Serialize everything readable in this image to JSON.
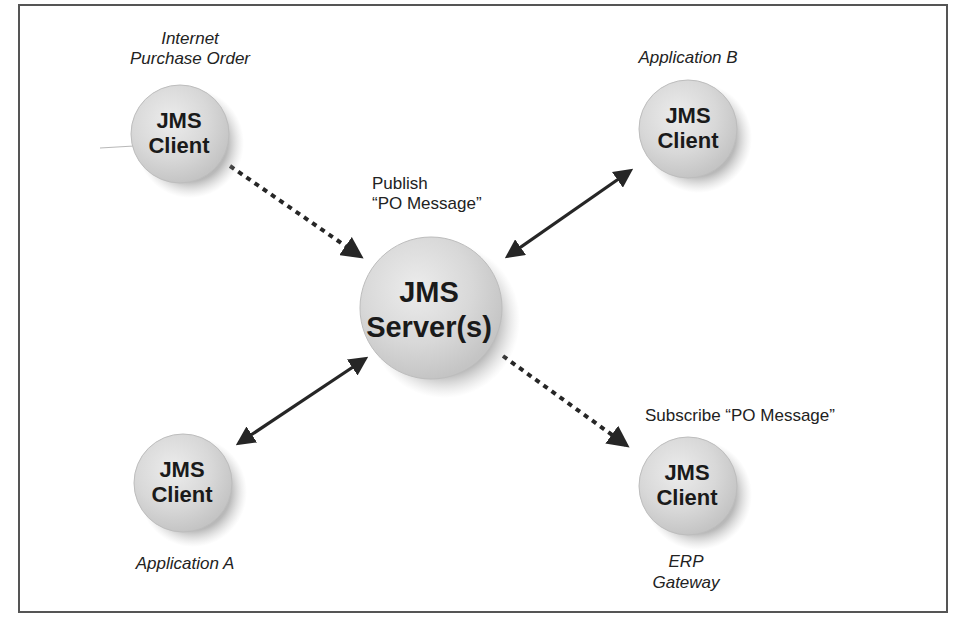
{
  "colors": {
    "frame": "#555555",
    "node_fill": "#d6d6d6",
    "node_highlight": "#eeeeee",
    "node_shadow": "#8a8a8a",
    "arrow": "#262626",
    "text": "#1a1a1a"
  },
  "nodes": {
    "server": {
      "line1": "JMS",
      "line2": "Server(s)"
    },
    "internet_client": {
      "line1": "JMS",
      "line2": "Client",
      "caption_line1": "Internet",
      "caption_line2": "Purchase Order"
    },
    "app_b_client": {
      "line1": "JMS",
      "line2": "Client",
      "caption": "Application B"
    },
    "app_a_client": {
      "line1": "JMS",
      "line2": "Client",
      "caption": "Application A"
    },
    "erp_client": {
      "line1": "JMS",
      "line2": "Client",
      "caption_line1": "ERP",
      "caption_line2": "Gateway"
    }
  },
  "annotations": {
    "publish_line1": "Publish",
    "publish_line2": "“PO Message”",
    "subscribe": "Subscribe “PO Message”"
  },
  "edges": [
    {
      "from": "Internet Purchase Order client",
      "to": "JMS Server(s)",
      "style": "dotted",
      "direction": "one-way"
    },
    {
      "from": "JMS Server(s)",
      "to": "ERP Gateway client",
      "style": "dotted",
      "direction": "one-way"
    },
    {
      "from": "JMS Server(s)",
      "to": "Application B client",
      "style": "solid",
      "direction": "two-way"
    },
    {
      "from": "JMS Server(s)",
      "to": "Application A client",
      "style": "solid",
      "direction": "two-way"
    }
  ]
}
